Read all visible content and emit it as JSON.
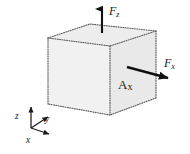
{
  "figure": {
    "background_color": "#ffffff",
    "stroke_color": "#4a4a4a",
    "arrow_color": "#111111",
    "face_fill_front": "#f1f1f1",
    "face_fill_top": "#ececec",
    "face_fill_right": "#e8e8e8",
    "labels": {
      "force_z": {
        "symbol": "F",
        "subscript": "z"
      },
      "force_x": {
        "symbol": "F",
        "subscript": "x"
      },
      "area_x": {
        "symbol": "A",
        "subscript": "x"
      }
    },
    "axes": {
      "z": "z",
      "y": "y",
      "x": "x"
    },
    "geometry": {
      "cube": {
        "front_top_left": [
          48,
          38
        ],
        "front_top_right": [
          110,
          46
        ],
        "front_bottom_right": [
          110,
          115
        ],
        "front_bottom_left": [
          48,
          104
        ],
        "back_top_left": [
          90,
          24
        ],
        "back_top_right": [
          156,
          31
        ],
        "back_bottom_right": [
          156,
          98
        ]
      },
      "arrow_fz": {
        "from": [
          102,
          33
        ],
        "to": [
          102,
          7
        ]
      },
      "arrow_fx": {
        "from": [
          127,
          67
        ],
        "to": [
          171,
          79
        ]
      },
      "triad_origin": [
        31,
        128
      ],
      "triad_z_tip": [
        31,
        104
      ],
      "triad_y_tip": [
        50,
        115
      ],
      "triad_x_tip": [
        52,
        134
      ]
    }
  }
}
